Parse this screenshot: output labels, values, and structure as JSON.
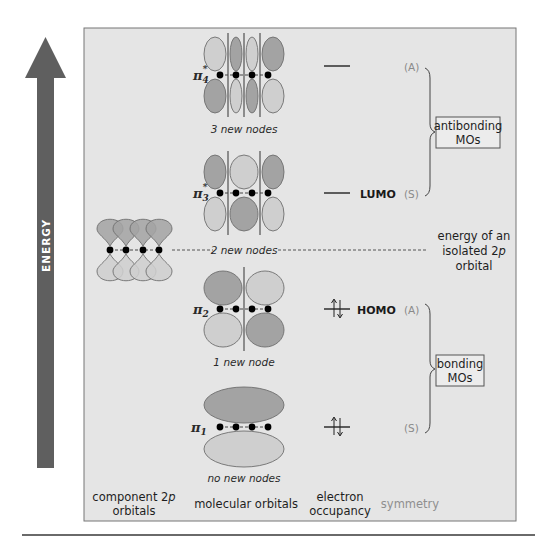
{
  "energy_axis": {
    "label": "ENERGY",
    "direction": "up"
  },
  "colors": {
    "panel_bg": "#e5e5e5",
    "panel_border": "#777777",
    "arrow": "#5f5f5f",
    "lobe_dark": "#a3a3a3",
    "lobe_light": "#cfcfcf",
    "lobe_stroke": "#6e6e6e",
    "node_line": "#8c8c8c",
    "atom": "#000000"
  },
  "component_orbitals": {
    "atom_count": 4,
    "reference_label": "energy of an isolated 2p orbital",
    "reference_label_lines": [
      "energy of an",
      "isolated 2",
      "orbital"
    ],
    "reference_label_italic": "p"
  },
  "molecular_orbitals": [
    {
      "id": "pi4",
      "symbol": "π",
      "subscript": "4",
      "star": "*",
      "nodes_label": "3 new nodes",
      "node_count": 3,
      "top_phases": [
        "light",
        "dark",
        "light",
        "dark"
      ],
      "bottom_phases": [
        "dark",
        "light",
        "dark",
        "light"
      ],
      "electrons": 0,
      "frontier_tag": "",
      "symmetry": "(A)"
    },
    {
      "id": "pi3",
      "symbol": "π",
      "subscript": "3",
      "star": "*",
      "nodes_label": "2 new nodes",
      "node_count": 2,
      "top_phases": [
        "dark",
        "light",
        "dark"
      ],
      "bottom_phases": [
        "light",
        "dark",
        "light"
      ],
      "electrons": 0,
      "frontier_tag": "LUMO",
      "symmetry": "(S)"
    },
    {
      "id": "pi2",
      "symbol": "π",
      "subscript": "2",
      "star": "",
      "nodes_label": "1 new node",
      "node_count": 1,
      "top_phases": [
        "dark",
        "light"
      ],
      "bottom_phases": [
        "light",
        "dark"
      ],
      "electrons": 2,
      "frontier_tag": "HOMO",
      "symmetry": "(A)"
    },
    {
      "id": "pi1",
      "symbol": "π",
      "subscript": "1",
      "star": "",
      "nodes_label": "no new nodes",
      "node_count": 0,
      "top_phases": [
        "dark"
      ],
      "bottom_phases": [
        "light"
      ],
      "electrons": 2,
      "frontier_tag": "",
      "symmetry": "(S)"
    }
  ],
  "groups": {
    "antibonding": {
      "line1": "antibonding",
      "line2": "MOs"
    },
    "bonding": {
      "line1": "bonding",
      "line2": "MOs"
    }
  },
  "columns": {
    "component": {
      "line1_pre": "component 2",
      "line1_italic": "p",
      "line2": "orbitals"
    },
    "molecular": "molecular orbitals",
    "occupancy": {
      "line1": "electron",
      "line2": "occupancy"
    },
    "symmetry": "symmetry"
  }
}
